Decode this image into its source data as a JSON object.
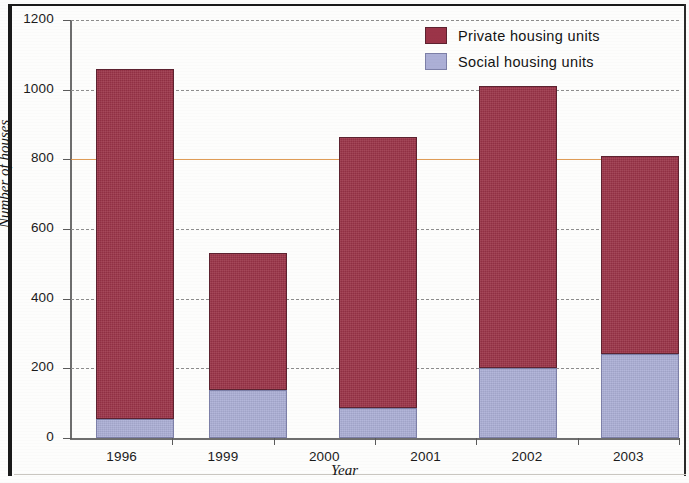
{
  "chart_data": {
    "type": "bar",
    "subtype": "stacked-bar",
    "title": "",
    "xlabel": "Year",
    "ylabel": "Number of houses",
    "categories": [
      "1996",
      "1999",
      "2000",
      "2001",
      "2002",
      "2003"
    ],
    "ylim": [
      0,
      1200
    ],
    "ytick_step": 200,
    "yticks": [
      0,
      200,
      400,
      600,
      800,
      1000,
      1200
    ],
    "grid": "horizontal-dashed",
    "legend_position": "top-right",
    "highlight_line": {
      "value": 800,
      "color": "#d98b3a"
    },
    "series": [
      {
        "name": "Social housing units",
        "color": "#acafd6",
        "values": [
          55,
          138,
          86,
          null,
          201,
          241
        ]
      },
      {
        "name": "Private housing units",
        "color": "#9b3448",
        "values": [
          1003,
          393,
          778,
          null,
          809,
          569
        ]
      }
    ],
    "totals": [
      1058,
      531,
      864,
      null,
      1010,
      810
    ],
    "bars": [
      {
        "category": "1996",
        "left_px": 25,
        "width_px": 78,
        "social": 55,
        "private": 1003,
        "total": 1058
      },
      {
        "category": "1999",
        "left_px": 138,
        "width_px": 78,
        "social": 138,
        "private": 393,
        "total": 531
      },
      {
        "category": "2000",
        "left_px": 268,
        "width_px": 78,
        "social": 86,
        "private": 778,
        "total": 864
      },
      {
        "category": "2002",
        "left_px": 408,
        "width_px": 78,
        "social": 201,
        "private": 809,
        "total": 1010
      },
      {
        "category": "2003",
        "left_px": 530,
        "width_px": 78,
        "social": 241,
        "private": 569,
        "total": 810
      }
    ]
  },
  "legend": {
    "items": [
      {
        "label": "Private housing units",
        "color": "#9b3448",
        "key": "private"
      },
      {
        "label": "Social housing units",
        "color": "#acafd6",
        "key": "social"
      }
    ]
  },
  "axes": {
    "y": {
      "label": "Number of houses",
      "ticks": [
        "1200",
        "1000",
        "800",
        "600",
        "400",
        "200",
        "0"
      ]
    },
    "x": {
      "label": "Year",
      "ticks": [
        "1996",
        "1999",
        "2000",
        "2001",
        "2002",
        "2003"
      ]
    }
  }
}
